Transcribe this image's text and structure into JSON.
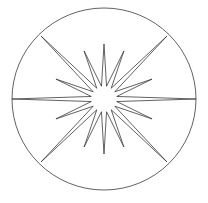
{
  "figure": {
    "background_color": "#ffffff",
    "stroke_color": "#3a3a3a",
    "stroke_width": 0.8,
    "width": 208,
    "height": 203
  },
  "circle": {
    "label": "outer-circle",
    "center_x": 104,
    "center_y": 99,
    "radius_x": 92,
    "radius_y": 91
  },
  "star": {
    "label": "sixteen-point-star",
    "center_x": 104,
    "center_y": 99,
    "point_count": 16,
    "inner_radius": 13,
    "long_point_radius": 92,
    "short_point_radius": 52,
    "vertical_point_radius": 55,
    "rotation_deg": 0,
    "points": [
      {
        "name": "point-E",
        "angle_deg": 0,
        "radius": 92,
        "kind": "long"
      },
      {
        "name": "point-ENE",
        "angle_deg": 22.5,
        "radius": 52,
        "kind": "short"
      },
      {
        "name": "point-NE",
        "angle_deg": 45,
        "radius": 89,
        "kind": "long"
      },
      {
        "name": "point-NNE",
        "angle_deg": 67.5,
        "radius": 52,
        "kind": "short"
      },
      {
        "name": "point-N",
        "angle_deg": 90,
        "radius": 55,
        "kind": "long"
      },
      {
        "name": "point-NNW",
        "angle_deg": 112.5,
        "radius": 52,
        "kind": "short"
      },
      {
        "name": "point-NW",
        "angle_deg": 135,
        "radius": 89,
        "kind": "long"
      },
      {
        "name": "point-WNW",
        "angle_deg": 157.5,
        "radius": 52,
        "kind": "short"
      },
      {
        "name": "point-W",
        "angle_deg": 180,
        "radius": 92,
        "kind": "long"
      },
      {
        "name": "point-WSW",
        "angle_deg": 202.5,
        "radius": 52,
        "kind": "short"
      },
      {
        "name": "point-SW",
        "angle_deg": 225,
        "radius": 89,
        "kind": "long"
      },
      {
        "name": "point-SSW",
        "angle_deg": 247.5,
        "radius": 52,
        "kind": "short"
      },
      {
        "name": "point-S",
        "angle_deg": 270,
        "radius": 55,
        "kind": "long"
      },
      {
        "name": "point-SSE",
        "angle_deg": 292.5,
        "radius": 52,
        "kind": "short"
      },
      {
        "name": "point-SE",
        "angle_deg": 315,
        "radius": 89,
        "kind": "long"
      },
      {
        "name": "point-ESE",
        "angle_deg": 337.5,
        "radius": 52,
        "kind": "short"
      }
    ]
  }
}
